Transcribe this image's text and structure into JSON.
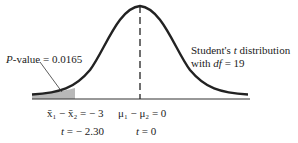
{
  "figure": {
    "p_value_label": "P",
    "p_value_text": "-value = 0.0165",
    "distribution_line1_a": "Student's ",
    "distribution_line1_t": "t",
    "distribution_line1_b": " distribution",
    "distribution_line2_a": "with ",
    "distribution_line2_df": "df",
    "distribution_line2_b": " = 19",
    "x_left_label": "x̄₁ − x̄₂ = − 3",
    "x_center_label": "μ₁ − μ₂ = 0",
    "t_left_t": "t",
    "t_left_value": " = − 2.30",
    "t_center_t": "t",
    "t_center_value": " = 0",
    "colors": {
      "curve": "#222222",
      "shade": "#b8b8b8"
    }
  }
}
